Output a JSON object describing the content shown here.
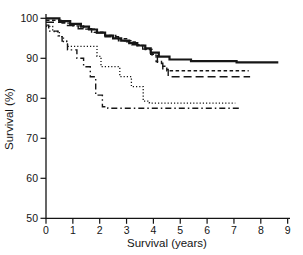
{
  "chart_data": {
    "type": "line",
    "subtype": "kaplan-meier-step-curves",
    "title": "",
    "xlabel": "Survival (years)",
    "ylabel": "Survival (%)",
    "xlim": [
      0,
      9
    ],
    "ylim": [
      50,
      100
    ],
    "x_ticks": [
      0,
      1,
      2,
      3,
      4,
      5,
      6,
      7,
      8,
      9
    ],
    "y_ticks": [
      100,
      90,
      80,
      70,
      60,
      50
    ],
    "grid": false,
    "legend_position": "none",
    "line_color": "#161616",
    "axis_color": "#141414",
    "series": [
      {
        "name": "group-1-solid",
        "style": "solid",
        "dash": "",
        "width": 2.2,
        "points": [
          [
            0,
            100
          ],
          [
            0.5,
            99.3
          ],
          [
            0.9,
            98.6
          ],
          [
            1.3,
            97.9
          ],
          [
            1.6,
            97.2
          ],
          [
            1.9,
            96.4
          ],
          [
            2.2,
            95.7
          ],
          [
            2.5,
            95.0
          ],
          [
            2.8,
            94.4
          ],
          [
            3.1,
            93.8
          ],
          [
            3.4,
            93.2
          ],
          [
            3.7,
            92.5
          ],
          [
            3.9,
            91.4
          ],
          [
            4.2,
            90.4
          ],
          [
            4.6,
            89.7
          ],
          [
            5.4,
            89.3
          ],
          [
            7.1,
            89.0
          ],
          [
            8.65,
            89.0
          ]
        ]
      },
      {
        "name": "group-2-short-dash",
        "style": "short-dash",
        "dash": "3.5 2.5",
        "width": 1.4,
        "points": [
          [
            0,
            99.5
          ],
          [
            0.6,
            98.8
          ],
          [
            1.0,
            98.1
          ],
          [
            1.4,
            97.3
          ],
          [
            1.8,
            96.5
          ],
          [
            2.2,
            95.7
          ],
          [
            2.6,
            94.9
          ],
          [
            3.0,
            94.1
          ],
          [
            3.4,
            93.2
          ],
          [
            3.7,
            92.2
          ],
          [
            3.95,
            90.8
          ],
          [
            4.1,
            89.2
          ],
          [
            4.3,
            88.0
          ],
          [
            4.5,
            86.9
          ],
          [
            7.55,
            86.9
          ]
        ]
      },
      {
        "name": "group-3-long-dash",
        "style": "long-dash",
        "dash": "8 4",
        "width": 1.4,
        "points": [
          [
            0,
            99.0
          ],
          [
            0.7,
            98.2
          ],
          [
            1.2,
            97.4
          ],
          [
            1.7,
            96.4
          ],
          [
            2.2,
            95.4
          ],
          [
            2.7,
            94.4
          ],
          [
            3.2,
            93.4
          ],
          [
            3.6,
            92.3
          ],
          [
            3.9,
            91.0
          ],
          [
            4.15,
            88.8
          ],
          [
            4.35,
            87.2
          ],
          [
            4.55,
            85.4
          ],
          [
            7.6,
            85.4
          ]
        ]
      },
      {
        "name": "group-4-dotted",
        "style": "dotted",
        "dash": "1.2 2",
        "width": 1.3,
        "points": [
          [
            0,
            98.0
          ],
          [
            0.25,
            96.7
          ],
          [
            0.5,
            95.4
          ],
          [
            0.65,
            94.2
          ],
          [
            0.8,
            93.0
          ],
          [
            1.9,
            90.5
          ],
          [
            2.05,
            87.9
          ],
          [
            2.75,
            85.4
          ],
          [
            3.18,
            82.9
          ],
          [
            3.62,
            79.3
          ],
          [
            3.85,
            78.8
          ],
          [
            7.05,
            78.8
          ]
        ]
      },
      {
        "name": "group-5-dash-dot",
        "style": "dash-dot",
        "dash": "6 3 1.5 3",
        "width": 1.4,
        "points": [
          [
            0,
            98.3
          ],
          [
            0.1,
            96.8
          ],
          [
            0.45,
            95.6
          ],
          [
            0.6,
            94.3
          ],
          [
            0.8,
            92.1
          ],
          [
            1.15,
            90.0
          ],
          [
            1.4,
            87.9
          ],
          [
            1.65,
            85.4
          ],
          [
            1.85,
            80.8
          ],
          [
            2.1,
            77.9
          ],
          [
            2.3,
            77.5
          ],
          [
            7.25,
            77.5
          ]
        ]
      }
    ]
  }
}
